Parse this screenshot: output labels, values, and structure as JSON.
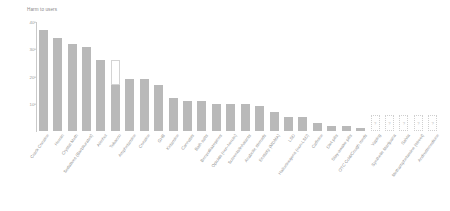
{
  "chart": {
    "axis_title": "Harm to users",
    "type": "bar"
  },
  "chart_data": {
    "type": "bar",
    "title": "Harm to users",
    "xlabel": "",
    "ylabel": "Harm to users",
    "ylim": [
      0,
      40
    ],
    "yticks": [
      10,
      20,
      30,
      40
    ],
    "ytick_labels": [
      "10",
      "20",
      "30",
      "40"
    ],
    "grid": false,
    "legend": "none",
    "categories": [
      "Crack Cocaine",
      "Heroin",
      "Crystal Meth",
      "Sedatives (Barbiturates)",
      "Alcohol",
      "Tobacco",
      "Amphetamine",
      "Cocaine",
      "GHB",
      "Ketamine",
      "Cannabis",
      "Bath salts",
      "Benzodiazepines",
      "Opioids (non-heroin)",
      "Solvents/Inhalants",
      "Anabolic steroids",
      "Ecstasy (MDMA)",
      "LSD",
      "Hallucinogens (non-LSD)",
      "Caffeine",
      "Diet pills",
      "Stay-awake pills",
      "OTC Cold/Cough meds",
      "Vaping",
      "Synthetic Marijuana",
      "Salvia",
      "Methamphetamine (street)",
      "Androstenedione"
    ],
    "values": [
      37,
      34,
      32,
      31,
      26,
      17,
      19,
      19,
      17,
      12,
      11,
      11,
      10,
      10,
      10,
      9,
      7,
      5,
      5,
      3,
      2,
      2,
      1,
      null,
      null,
      null,
      null,
      null
    ],
    "extension_values": [
      null,
      null,
      null,
      null,
      null,
      26,
      null,
      null,
      null,
      null,
      null,
      null,
      null,
      null,
      null,
      null,
      null,
      null,
      null,
      null,
      null,
      null,
      null,
      null,
      null,
      null,
      null,
      null
    ],
    "unknown_markers": [
      false,
      false,
      false,
      false,
      false,
      false,
      false,
      false,
      false,
      false,
      false,
      false,
      false,
      false,
      false,
      false,
      false,
      false,
      false,
      false,
      false,
      false,
      false,
      true,
      true,
      true,
      true,
      true
    ],
    "unknown_label": "?",
    "unknown_bar_height": 6,
    "colors": {
      "bar_fill": "#b9b9b9",
      "hollow_fill": "#ffffff",
      "hollow_border": "#d4d4d4",
      "axis": "#c9c9c9",
      "text": "#8f8f8f"
    }
  }
}
